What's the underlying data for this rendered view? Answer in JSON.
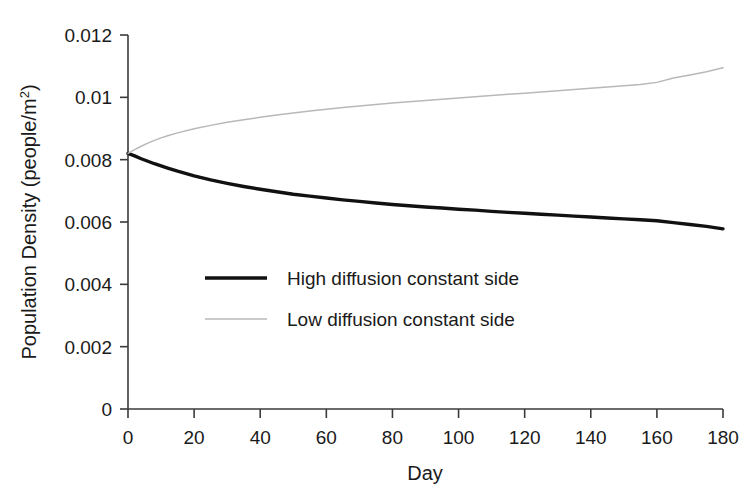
{
  "chart_data": {
    "type": "line",
    "title": "",
    "xlabel": "Day",
    "ylabel": "Population Density (people/m2)",
    "ylabel_base": "Population Density (people/m",
    "ylabel_sup": "2",
    "ylabel_tail": ")",
    "xlim": [
      0,
      180
    ],
    "ylim": [
      0,
      0.012
    ],
    "grid": false,
    "legend_position": "center-left-inside",
    "xticks": [
      0,
      20,
      40,
      60,
      80,
      100,
      120,
      140,
      160,
      180
    ],
    "xtick_labels": [
      "0",
      "20",
      "40",
      "60",
      "80",
      "100",
      "120",
      "140",
      "160",
      "180"
    ],
    "yticks": [
      0,
      0.002,
      0.004,
      0.006,
      0.008,
      0.01,
      0.012
    ],
    "ytick_labels": [
      "0",
      "0.002",
      "0.004",
      "0.006",
      "0.008",
      "0.01",
      "0.012"
    ],
    "x": [
      0,
      2,
      4,
      6,
      8,
      10,
      12,
      15,
      20,
      25,
      30,
      35,
      40,
      45,
      50,
      55,
      60,
      65,
      70,
      75,
      80,
      85,
      90,
      95,
      100,
      105,
      110,
      115,
      120,
      125,
      130,
      135,
      140,
      145,
      150,
      155,
      160,
      165,
      170,
      175,
      180
    ],
    "series": [
      {
        "name": "High diffusion constant side",
        "color": "#111111",
        "line_width": 3.4,
        "values": [
          0.0082,
          0.00812,
          0.00803,
          0.00795,
          0.00787,
          0.0078,
          0.00773,
          0.00763,
          0.00748,
          0.00735,
          0.00724,
          0.00714,
          0.00705,
          0.00697,
          0.00689,
          0.00683,
          0.00677,
          0.00671,
          0.00666,
          0.00661,
          0.00656,
          0.00652,
          0.00648,
          0.00645,
          0.00641,
          0.00638,
          0.00634,
          0.00631,
          0.00628,
          0.00625,
          0.00622,
          0.00619,
          0.00616,
          0.00613,
          0.0061,
          0.00607,
          0.00604,
          0.00598,
          0.00592,
          0.00586,
          0.00578
        ]
      },
      {
        "name": "Low diffusion constant side",
        "color": "#b8b8b8",
        "line_width": 1.5,
        "values": [
          0.0082,
          0.00832,
          0.00843,
          0.00853,
          0.00862,
          0.0087,
          0.00877,
          0.00886,
          0.00899,
          0.0091,
          0.0092,
          0.00928,
          0.00936,
          0.00943,
          0.0095,
          0.00956,
          0.00962,
          0.00967,
          0.00972,
          0.00977,
          0.00982,
          0.00986,
          0.0099,
          0.00994,
          0.00998,
          0.01002,
          0.01006,
          0.0101,
          0.01013,
          0.01017,
          0.01021,
          0.01025,
          0.01029,
          0.01033,
          0.01037,
          0.01041,
          0.01048,
          0.01062,
          0.01072,
          0.01082,
          0.01095
        ]
      }
    ],
    "legend": [
      {
        "label": "High diffusion constant side",
        "color": "#111111",
        "line_width": 3.4
      },
      {
        "label": "Low diffusion constant side",
        "color": "#b8b8b8",
        "line_width": 1.5
      }
    ]
  }
}
